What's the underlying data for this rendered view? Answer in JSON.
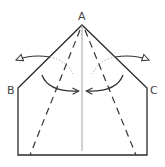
{
  "diagram": {
    "type": "origami-fold-instruction",
    "labels": {
      "apex": "A",
      "left_corner": "B",
      "right_corner": "C"
    },
    "colors": {
      "outline": "#2a2a2a",
      "center_line": "#9a9a9a",
      "fold_line": "#333333",
      "dotted_arc": "#999999",
      "arrow": "#333333"
    },
    "elements": [
      "pentagon paper outline (house shape) with apex A",
      "vertical center crease",
      "two valley-fold dashed lines from A to bottom edge",
      "dotted arcs indicating fold paths",
      "curved arrows: fold flaps toward center, unfold outward"
    ]
  }
}
